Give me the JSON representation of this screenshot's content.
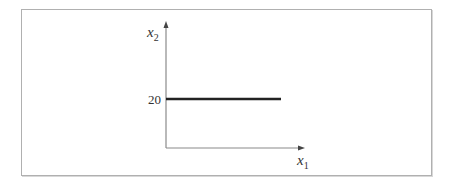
{
  "diagram": {
    "y_axis_label": "x",
    "y_axis_subscript": "2",
    "x_axis_label": "x",
    "x_axis_subscript": "1",
    "y_tick_label": "20",
    "line": {
      "type": "horizontal",
      "y_value": 20,
      "color": "#222222"
    },
    "axis_color": "#888888",
    "frame_color": "#b0b0b0"
  }
}
